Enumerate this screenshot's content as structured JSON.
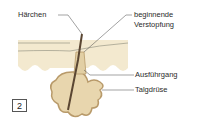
{
  "figure": {
    "number": "2",
    "labels": {
      "hair": "Härchen",
      "blockage_line1": "beginnende",
      "blockage_line2": "Verstopfung",
      "duct": "Ausführgang",
      "gland": "Talgdrüse"
    },
    "colors": {
      "skin": "#f3e9cf",
      "gland_fill": "#e8d6ae",
      "gland_outline": "#b89a6a",
      "hair": "#5a4632",
      "leader_line": "#444444"
    }
  }
}
